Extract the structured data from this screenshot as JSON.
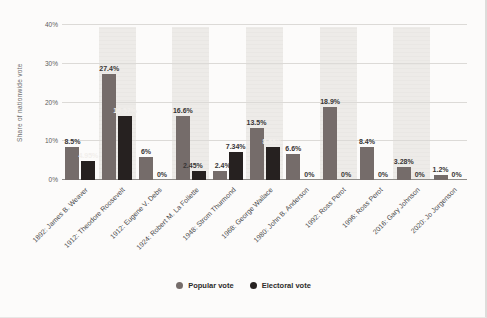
{
  "chart_data": {
    "type": "bar",
    "title": "",
    "ylabel": "Share of nationwide vote",
    "xlabel": "",
    "ylim": [
      0,
      40
    ],
    "yticks": [
      "0%",
      "10%",
      "20%",
      "30%",
      "40%"
    ],
    "grid": true,
    "legend_position": "bottom",
    "categories": [
      "1892: James B. Weaver",
      "1912: Theodore Roosevelt",
      "1912: Eugene V. Debs",
      "1924: Robert M. La Follette",
      "1948: Strom Thurmond",
      "1968: George Wallace",
      "1980: John B. Anderson",
      "1992: Ross Perot",
      "1996: Ross Perot",
      "2016: Gary Johnson",
      "2020: Jo Jorgenson"
    ],
    "series": [
      {
        "name": "Popular vote",
        "color": "#756c6a",
        "values": [
          8.5,
          27.4,
          6,
          16.6,
          2.4,
          13.5,
          6.6,
          18.9,
          8.4,
          3.28,
          1.2
        ],
        "labels": [
          "8.5%",
          "27.4%",
          "6%",
          "16.6%",
          "2.4%",
          "13.5%",
          "6.6%",
          "18.9%",
          "8.4%",
          "3.28%",
          "1.2%"
        ],
        "label_dx": [
          0,
          0,
          0,
          0,
          3,
          0,
          0,
          0,
          0,
          0,
          0
        ],
        "light_labels": [
          false,
          false,
          false,
          false,
          false,
          false,
          false,
          false,
          false,
          false,
          false
        ]
      },
      {
        "name": "Electoral vote",
        "color": "#262120",
        "values": [
          4.95,
          16.57,
          0,
          2.45,
          7.34,
          8.55,
          0,
          0,
          0,
          0,
          0
        ],
        "labels": [
          "4.95%",
          "16.57%",
          "0%",
          "2.45%",
          "7.34%",
          "8.55%",
          "0%",
          "0%",
          "0%",
          "0%",
          "0%"
        ],
        "label_dx": [
          0,
          0,
          0,
          -6,
          0,
          0,
          0,
          0,
          0,
          0,
          0
        ],
        "light_labels": [
          true,
          true,
          false,
          false,
          false,
          true,
          false,
          false,
          false,
          false,
          false
        ]
      }
    ],
    "striped_categories": [
      1,
      3,
      5,
      7,
      9
    ],
    "stripe_color": "#ebe9e6",
    "axis_color": "#8e8c89",
    "grid_color": "#dcdad7"
  }
}
